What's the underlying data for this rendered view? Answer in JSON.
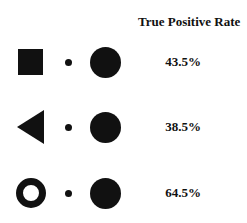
{
  "header": {
    "title": "True Positive Rate"
  },
  "rows": [
    {
      "left_shape": "filled-square",
      "middle_shape": "small-dot",
      "right_shape": "large-filled-circle",
      "value": "43.5%"
    },
    {
      "left_shape": "left-pointing-triangle",
      "middle_shape": "small-dot",
      "right_shape": "large-filled-circle",
      "value": "38.5%"
    },
    {
      "left_shape": "ring",
      "middle_shape": "small-dot",
      "right_shape": "large-filled-circle",
      "value": "64.5%"
    }
  ],
  "colors": {
    "shape": "#111111",
    "background": "#ffffff"
  }
}
